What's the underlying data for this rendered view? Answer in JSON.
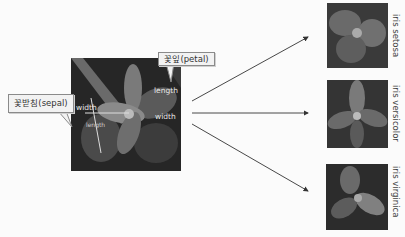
{
  "main_figure": {
    "callouts": {
      "petal": "꽃잎(petal)",
      "sepal": "꽃받침(sepal)"
    },
    "petal_labels": {
      "length": "length",
      "width": "width"
    },
    "sepal_labels": {
      "width": "width",
      "length": "length"
    }
  },
  "species": [
    {
      "name": "iris setosa"
    },
    {
      "name": "iris versicolor"
    },
    {
      "name": "iris virginica"
    }
  ],
  "colors": {
    "background": "#fbfbfb",
    "arrow": "#333333",
    "callout_fill": "#f2f2f2",
    "callout_border": "#8a8a8a"
  }
}
